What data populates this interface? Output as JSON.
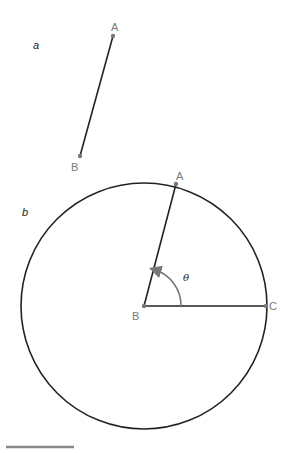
{
  "panels": {
    "a": {
      "label": "a",
      "points": {
        "A": "A",
        "B": "B"
      }
    },
    "b": {
      "label": "b",
      "points": {
        "A": "A",
        "B": "B",
        "C": "C"
      },
      "angle_label": "θ"
    }
  },
  "colors": {
    "line": "#222222",
    "point": "#777777",
    "angle_arrow": "#777777",
    "scale_bar": "#888888"
  }
}
